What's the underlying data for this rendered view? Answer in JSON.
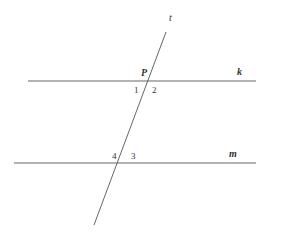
{
  "diagram": {
    "type": "parallel-lines-transversal",
    "line_color": "#666666",
    "text_color": "#333333",
    "lines": [
      {
        "name": "k",
        "label": "k",
        "x1": 28,
        "y1": 81,
        "x2": 256,
        "y2": 81
      },
      {
        "name": "m",
        "label": "m",
        "x1": 14,
        "y1": 163,
        "x2": 256,
        "y2": 163
      },
      {
        "name": "t",
        "label": "t",
        "x1": 166,
        "y1": 32,
        "x2": 94,
        "y2": 225
      }
    ],
    "point": {
      "label": "P"
    },
    "angles": [
      "1",
      "2",
      "3",
      "4"
    ]
  }
}
